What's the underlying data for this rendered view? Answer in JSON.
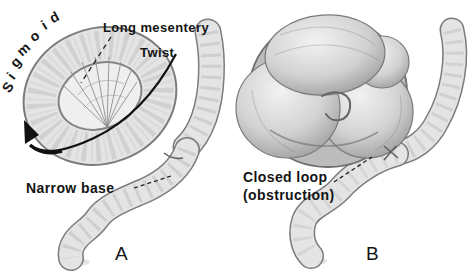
{
  "panel_a": {
    "panel_letter": "A",
    "sigmoid_letters": [
      "S",
      "i",
      "g",
      "m",
      "o",
      "i",
      "d"
    ],
    "labels": {
      "long_mesentery": "Long mesentery",
      "twist": "Twist",
      "narrow_base": "Narrow base"
    }
  },
  "panel_b": {
    "panel_letter": "B",
    "labels": {
      "closed_loop": "Closed loop",
      "obstruction": "(obstruction)"
    }
  },
  "colors": {
    "background": "#ffffff",
    "ink": "#141414",
    "bowel_fill": "#e4e4e4",
    "bowel_outline": "#7c7c7c",
    "haustra_band": "#bdbdbd",
    "mass_dark": "#8f8f8f"
  }
}
